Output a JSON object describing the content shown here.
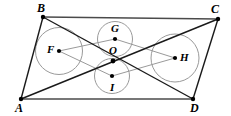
{
  "figure": {
    "type": "geometry-diagram",
    "stroke_color": "#1a1a1a",
    "light_stroke_color": "#9a9a9a",
    "circle_stroke_color": "#9a9a9a",
    "background_color": "#ffffff",
    "dot_color": "#000000",
    "width": 231,
    "height": 116
  },
  "vertices": [
    {
      "name": "A",
      "label": "A",
      "x": 21,
      "y": 99,
      "label_x": 15,
      "label_y": 102
    },
    {
      "name": "B",
      "label": "B",
      "x": 43,
      "y": 17,
      "label_x": 37,
      "label_y": 2
    },
    {
      "name": "C",
      "label": "C",
      "x": 218,
      "y": 19,
      "label_x": 211,
      "label_y": 3
    },
    {
      "name": "D",
      "label": "D",
      "x": 193,
      "y": 99,
      "label_x": 190,
      "label_y": 102
    }
  ],
  "centers": [
    {
      "name": "O",
      "label": "O",
      "x": 113,
      "y": 61,
      "label_x": 109,
      "label_y": 45,
      "radius": 0
    },
    {
      "name": "F",
      "label": "F",
      "x": 59,
      "y": 51,
      "label_x": 47,
      "label_y": 45,
      "radius": 23.5
    },
    {
      "name": "G",
      "label": "G",
      "x": 115,
      "y": 39,
      "label_x": 111,
      "label_y": 23,
      "radius": 17.5
    },
    {
      "name": "H",
      "label": "H",
      "x": 175,
      "y": 58,
      "label_x": 180,
      "label_y": 52,
      "radius": 24
    },
    {
      "name": "I",
      "label": "I",
      "x": 112,
      "y": 76,
      "label_x": 109,
      "label_y": 82,
      "radius": 17.5
    }
  ],
  "sides": [
    {
      "name": "side-AB",
      "from": "A",
      "to": "B"
    },
    {
      "name": "side-BC",
      "from": "B",
      "to": "C"
    },
    {
      "name": "side-CD",
      "from": "C",
      "to": "D"
    },
    {
      "name": "side-DA",
      "from": "D",
      "to": "A"
    }
  ],
  "diagonals": [
    {
      "name": "diagonal-AC",
      "from": "A",
      "to": "C"
    },
    {
      "name": "diagonal-BD",
      "from": "B",
      "to": "D"
    }
  ],
  "connectors": [
    {
      "name": "connector-F-G",
      "from": "F",
      "to": "G"
    },
    {
      "name": "connector-G-H",
      "from": "G",
      "to": "H"
    },
    {
      "name": "connector-H-I",
      "from": "H",
      "to": "I"
    },
    {
      "name": "connector-I-F",
      "from": "I",
      "to": "F"
    }
  ]
}
